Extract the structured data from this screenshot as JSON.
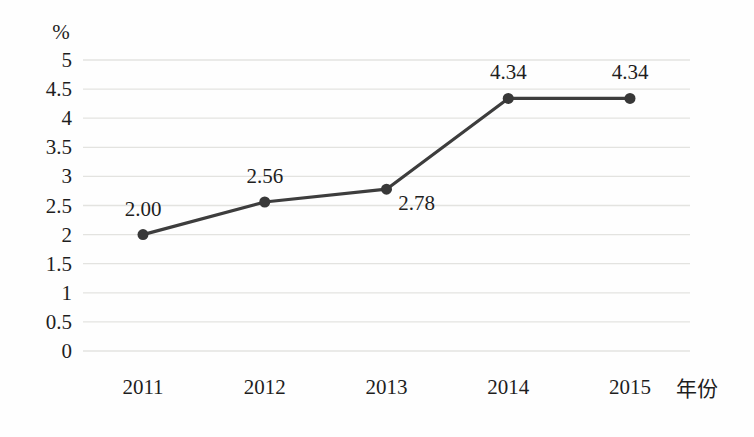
{
  "chart_data": {
    "type": "line",
    "title": "",
    "xlabel": "年份",
    "ylabel": "%",
    "categories": [
      "2011",
      "2012",
      "2013",
      "2014",
      "2015"
    ],
    "values": [
      2.0,
      2.56,
      2.78,
      4.34,
      4.34
    ],
    "point_labels": [
      "2.00",
      "2.56",
      "2.78",
      "4.34",
      "4.34"
    ],
    "point_label_positions": [
      "above",
      "above",
      "below-right",
      "above",
      "above"
    ],
    "ylim": [
      0,
      5
    ],
    "ytick_step": 0.5,
    "yticks": [
      "0",
      "0.5",
      "1",
      "1.5",
      "2",
      "2.5",
      "3",
      "3.5",
      "4",
      "4.5",
      "5"
    ],
    "grid": true,
    "legend": "none",
    "series_name": "",
    "colors": {
      "line": "#3d3d3d",
      "marker": "#383838",
      "grid": "#e3e3e0",
      "text": "#1e1e1e",
      "background": "#fefefe"
    }
  }
}
